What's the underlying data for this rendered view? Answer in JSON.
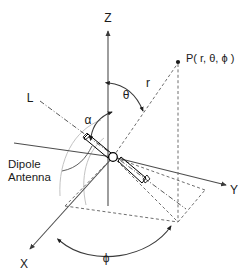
{
  "figure": {
    "background_color": "#ffffff",
    "line_color": "#4d4d4d",
    "accent_color": "#000000"
  },
  "axes": {
    "z": {
      "label": "Z",
      "x": 108,
      "y": 18
    },
    "y": {
      "label": "Y",
      "x": 234,
      "y": 190
    },
    "x": {
      "label": "X",
      "x": 24,
      "y": 264
    }
  },
  "angles": {
    "theta": {
      "label": "θ",
      "x": 124,
      "y": 97,
      "between": "Z-axis and r"
    },
    "alpha": {
      "label": "α",
      "x": 88,
      "y": 120,
      "between": "dipole axis L and Z-axis"
    },
    "phi": {
      "label": "ϕ",
      "x": 106,
      "y": 258,
      "between": "X-axis and projection of r"
    }
  },
  "radial": {
    "label": "r",
    "x": 148,
    "y": 83
  },
  "point": {
    "label": "P( r, θ, ϕ )",
    "x": 180,
    "y": 58,
    "marker_x": 178,
    "marker_y": 62
  },
  "antenna": {
    "axis_label": "L",
    "axis_label_x": 30,
    "axis_label_y": 98,
    "annotation_line_1": "Dipole",
    "annotation_line_2": "Antenna",
    "annotation_x": 8,
    "annotation_y": 166,
    "feed_x": 113,
    "feed_y": 157
  }
}
